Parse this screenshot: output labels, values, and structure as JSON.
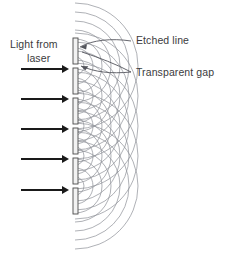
{
  "diagram": {
    "labels": {
      "source_line1": "Light from",
      "source_line2": "laser",
      "etched_line": "Etched line",
      "transparent_gap": "Transparent gap"
    },
    "colors": {
      "wave_arc": "#8d8f97",
      "barrier_stroke": "#4a4a4a",
      "barrier_fill": "#f2f2f2",
      "beam_arrow": "#1a1a1a",
      "leader": "#53555c",
      "text": "#3b3b3d",
      "background": "#ffffff"
    },
    "geometry": {
      "grating_x": 73,
      "barrier_width": 5,
      "segments": [
        {
          "y": 38,
          "height": 26
        },
        {
          "y": 68,
          "height": 26
        },
        {
          "y": 98,
          "height": 26
        },
        {
          "y": 128,
          "height": 26
        },
        {
          "y": 158,
          "height": 26
        },
        {
          "y": 188,
          "height": 26
        }
      ],
      "gaps_y": [
        66,
        96,
        126,
        156,
        186
      ],
      "beam_arrows": [
        {
          "y": 69,
          "x_start": 21,
          "x_end": 69
        },
        {
          "y": 99,
          "x_start": 21,
          "x_end": 69
        },
        {
          "y": 129,
          "x_start": 21,
          "x_end": 69
        },
        {
          "y": 159,
          "x_start": 21,
          "x_end": 69
        },
        {
          "y": 190,
          "x_start": 21,
          "x_end": 69
        }
      ],
      "arc_radii": [
        9,
        18,
        27,
        36,
        45,
        54,
        63
      ]
    }
  },
  "icons": {
    "beam_arrow": "right-arrow-icon",
    "leader_arrow": "leader-arrow-icon"
  }
}
